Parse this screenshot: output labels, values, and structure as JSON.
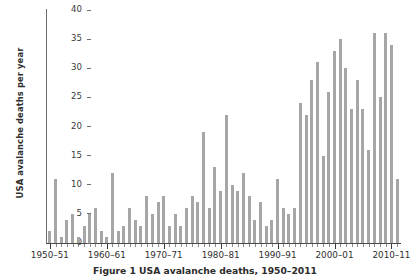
{
  "figure": {
    "caption_prefix": "Figure 1",
    "caption_text": "USA avalanche deaths, 1950–2011",
    "caption_full": "Figure 1 USA avalanche deaths, 1950–2011"
  },
  "axes": {
    "ylabel": "USA avalanche deaths per year",
    "xlabel": "",
    "yticks": [
      0,
      5,
      10,
      15,
      20,
      25,
      30,
      35,
      40
    ],
    "ytick_labels": [
      "0",
      "5",
      "10",
      "15",
      "20",
      "25",
      "30",
      "35",
      "40"
    ],
    "xtick_labels": [
      "1950–51",
      "1960–61",
      "1970–71",
      "1980–81",
      "1990–91",
      "2000–01",
      "2010–11"
    ],
    "xtick_seasons": [
      "1950-51",
      "1960-61",
      "1970-71",
      "1980-81",
      "1990-91",
      "2000-01",
      "2010-11"
    ]
  },
  "style": {
    "bar_color": "#a6a6a6",
    "axis_color": "#4a4a4a",
    "text_color": "#2e2e2e",
    "background": "#ffffff"
  },
  "chart_data": {
    "type": "bar",
    "title": "",
    "xlabel": "",
    "ylabel": "USA avalanche deaths per year",
    "ylim": [
      0,
      40
    ],
    "grid": false,
    "legend": null,
    "categories": [
      "1950-51",
      "1951-52",
      "1952-53",
      "1953-54",
      "1954-55",
      "1955-56",
      "1956-57",
      "1957-58",
      "1958-59",
      "1959-60",
      "1960-61",
      "1961-62",
      "1962-63",
      "1963-64",
      "1964-65",
      "1965-66",
      "1966-67",
      "1967-68",
      "1968-69",
      "1969-70",
      "1970-71",
      "1971-72",
      "1972-73",
      "1973-74",
      "1974-75",
      "1975-76",
      "1976-77",
      "1977-78",
      "1978-79",
      "1979-80",
      "1980-81",
      "1981-82",
      "1982-83",
      "1983-84",
      "1984-85",
      "1985-86",
      "1986-87",
      "1987-88",
      "1988-89",
      "1989-90",
      "1990-91",
      "1991-92",
      "1992-93",
      "1993-94",
      "1994-95",
      "1995-96",
      "1996-97",
      "1997-98",
      "1998-99",
      "1999-00",
      "2000-01",
      "2001-02",
      "2002-03",
      "2003-04",
      "2004-05",
      "2005-06",
      "2006-07",
      "2007-08",
      "2008-09",
      "2009-10",
      "2010-11",
      "2011-12"
    ],
    "values": [
      2,
      11,
      1,
      4,
      5,
      1,
      3,
      5,
      6,
      2,
      1,
      12,
      2,
      3,
      6,
      4,
      3,
      8,
      5,
      7,
      8,
      3,
      5,
      3,
      6,
      8,
      7,
      19,
      6,
      13,
      9,
      22,
      10,
      9,
      12,
      8,
      4,
      7,
      3,
      4,
      11,
      6,
      5,
      6,
      24,
      22,
      28,
      31,
      15,
      26,
      33,
      35,
      30,
      23,
      28,
      23,
      16,
      36,
      25,
      36,
      34,
      11
    ],
    "n_bars": 62,
    "max_value": 36,
    "min_value": 1
  }
}
